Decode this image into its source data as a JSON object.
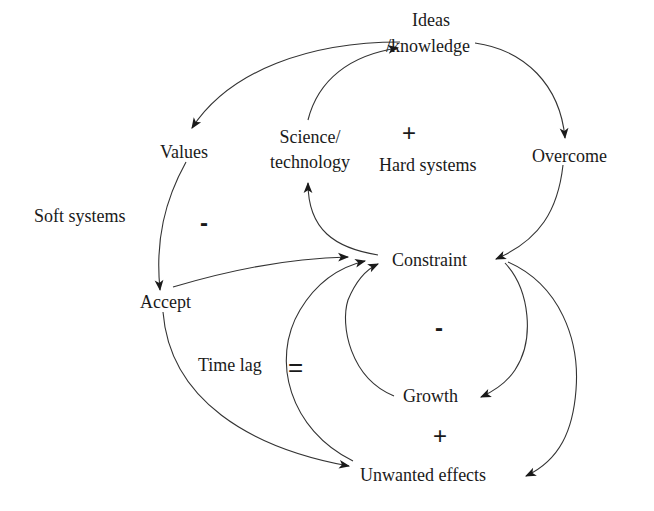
{
  "diagram": {
    "type": "causal-loop",
    "nodes": {
      "ideas": {
        "line1": "Ideas",
        "line2": "/knowledge"
      },
      "values": {
        "label": "Values"
      },
      "science": {
        "line1": "Science/",
        "line2": "technology"
      },
      "hard_systems": {
        "label": "Hard systems"
      },
      "overcome": {
        "label": "Overcome"
      },
      "soft_systems": {
        "label": "Soft systems"
      },
      "constraint": {
        "label": "Constraint"
      },
      "accept": {
        "label": "Accept"
      },
      "time_lag": {
        "label": "Time lag"
      },
      "growth": {
        "label": "Growth"
      },
      "unwanted": {
        "label": "Unwanted effects"
      }
    },
    "signs": {
      "hard_loop": "+",
      "soft_loop": "-",
      "growth_loop": "-",
      "unwanted_loop": "+",
      "delay_mark": "="
    },
    "edges": [
      {
        "from": "Ideas/knowledge",
        "to": "Values"
      },
      {
        "from": "Ideas/knowledge",
        "to": "Overcome"
      },
      {
        "from": "Science/technology",
        "to": "Ideas/knowledge"
      },
      {
        "from": "Overcome",
        "to": "Constraint"
      },
      {
        "from": "Constraint",
        "to": "Science/technology"
      },
      {
        "from": "Values",
        "to": "Accept"
      },
      {
        "from": "Accept",
        "to": "Constraint"
      },
      {
        "from": "Accept",
        "to": "Unwanted effects"
      },
      {
        "from": "Constraint",
        "to": "Growth"
      },
      {
        "from": "Growth",
        "to": "Constraint"
      },
      {
        "from": "Constraint",
        "to": "Unwanted effects"
      },
      {
        "from": "Unwanted effects",
        "to": "Constraint",
        "delay": true
      }
    ],
    "line_color": "#333333",
    "text_color": "#1a1a1a"
  }
}
